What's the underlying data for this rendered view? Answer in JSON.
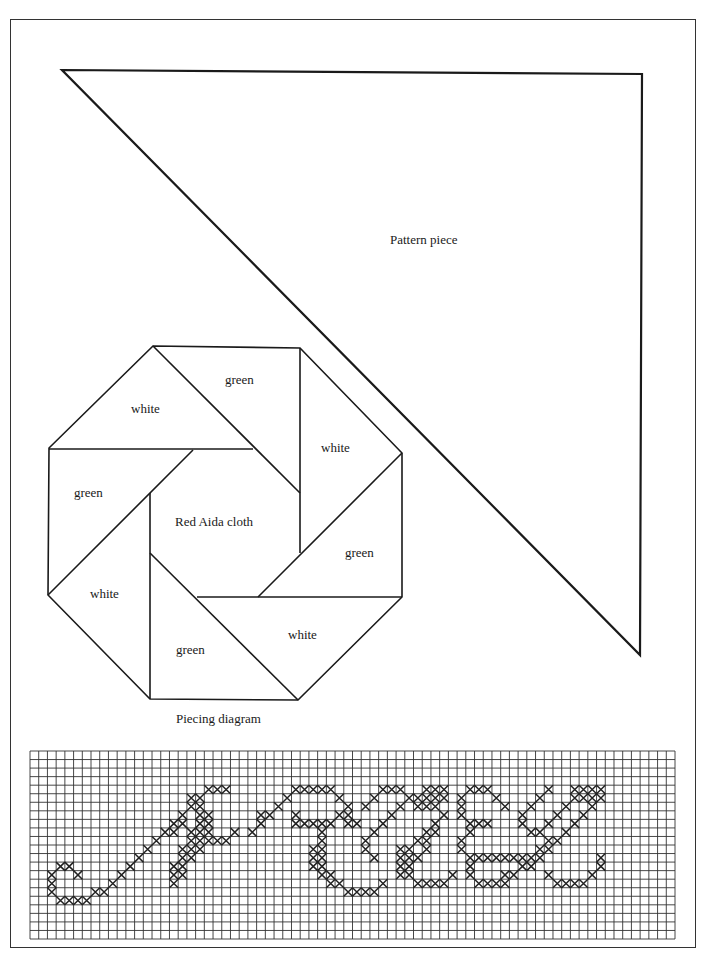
{
  "pattern_piece": {
    "label": "Pattern piece"
  },
  "piecing_diagram": {
    "caption": "Piecing diagram",
    "center_label": "Red Aida cloth",
    "pieces": [
      {
        "label": "white"
      },
      {
        "label": "green"
      },
      {
        "label": "white"
      },
      {
        "label": "green"
      },
      {
        "label": "white"
      },
      {
        "label": "green"
      },
      {
        "label": "white"
      },
      {
        "label": "green"
      }
    ]
  },
  "chart": {
    "columns": 74,
    "rows": 22,
    "stitches": [
      [
        3,
        13
      ],
      [
        4,
        13
      ],
      [
        2,
        14
      ],
      [
        5,
        14
      ],
      [
        2,
        15
      ],
      [
        2,
        16
      ],
      [
        3,
        17
      ],
      [
        4,
        17
      ],
      [
        5,
        17
      ],
      [
        6,
        17
      ],
      [
        7,
        16
      ],
      [
        8,
        16
      ],
      [
        9,
        15
      ],
      [
        10,
        14
      ],
      [
        11,
        13
      ],
      [
        12,
        12
      ],
      [
        13,
        11
      ],
      [
        14,
        10
      ],
      [
        15,
        9
      ],
      [
        16,
        8
      ],
      [
        17,
        7
      ],
      [
        18,
        6
      ],
      [
        19,
        5
      ],
      [
        20,
        4
      ],
      [
        21,
        4
      ],
      [
        22,
        4
      ],
      [
        18,
        5
      ],
      [
        17,
        8
      ],
      [
        16,
        9
      ],
      [
        19,
        6
      ],
      [
        19,
        7
      ],
      [
        20,
        7
      ],
      [
        19,
        8
      ],
      [
        20,
        8
      ],
      [
        18,
        9
      ],
      [
        19,
        9
      ],
      [
        20,
        9
      ],
      [
        18,
        10
      ],
      [
        19,
        10
      ],
      [
        20,
        10
      ],
      [
        21,
        10
      ],
      [
        22,
        10
      ],
      [
        17,
        11
      ],
      [
        18,
        11
      ],
      [
        19,
        11
      ],
      [
        23,
        9
      ],
      [
        17,
        12
      ],
      [
        18,
        12
      ],
      [
        16,
        13
      ],
      [
        17,
        13
      ],
      [
        16,
        14
      ],
      [
        17,
        14
      ],
      [
        16,
        15
      ],
      [
        25,
        9
      ],
      [
        26,
        8
      ],
      [
        27,
        7
      ],
      [
        28,
        6
      ],
      [
        29,
        5
      ],
      [
        30,
        4
      ],
      [
        31,
        4
      ],
      [
        26,
        7
      ],
      [
        30,
        7
      ],
      [
        30,
        8
      ],
      [
        32,
        4
      ],
      [
        33,
        4
      ],
      [
        34,
        4
      ],
      [
        35,
        5
      ],
      [
        36,
        6
      ],
      [
        35,
        7
      ],
      [
        34,
        8
      ],
      [
        33,
        8
      ],
      [
        32,
        8
      ],
      [
        31,
        8
      ],
      [
        36,
        7
      ],
      [
        36,
        8
      ],
      [
        37,
        8
      ],
      [
        33,
        9
      ],
      [
        33,
        10
      ],
      [
        32,
        11
      ],
      [
        33,
        11
      ],
      [
        32,
        12
      ],
      [
        33,
        12
      ],
      [
        32,
        13
      ],
      [
        33,
        13
      ],
      [
        33,
        14
      ],
      [
        34,
        14
      ],
      [
        34,
        15
      ],
      [
        35,
        15
      ],
      [
        36,
        16
      ],
      [
        37,
        16
      ],
      [
        38,
        16
      ],
      [
        39,
        16
      ],
      [
        40,
        15
      ],
      [
        38,
        6
      ],
      [
        39,
        5
      ],
      [
        40,
        4
      ],
      [
        41,
        4
      ],
      [
        42,
        4
      ],
      [
        43,
        5
      ],
      [
        42,
        6
      ],
      [
        41,
        7
      ],
      [
        40,
        8
      ],
      [
        39,
        9
      ],
      [
        38,
        10
      ],
      [
        38,
        11
      ],
      [
        39,
        12
      ],
      [
        44,
        5
      ],
      [
        44,
        6
      ],
      [
        45,
        4
      ],
      [
        46,
        4
      ],
      [
        47,
        4
      ],
      [
        45,
        5
      ],
      [
        46,
        5
      ],
      [
        47,
        5
      ],
      [
        45,
        6
      ],
      [
        46,
        6
      ],
      [
        47,
        7
      ],
      [
        46,
        8
      ],
      [
        46,
        9
      ],
      [
        45,
        9
      ],
      [
        45,
        10
      ],
      [
        44,
        10
      ],
      [
        43,
        11
      ],
      [
        42,
        11
      ],
      [
        42,
        12
      ],
      [
        43,
        12
      ],
      [
        42,
        13
      ],
      [
        43,
        13
      ],
      [
        42,
        14
      ],
      [
        43,
        14
      ],
      [
        44,
        15
      ],
      [
        45,
        15
      ],
      [
        46,
        15
      ],
      [
        47,
        15
      ],
      [
        48,
        14
      ],
      [
        44,
        12
      ],
      [
        45,
        11
      ],
      [
        50,
        4
      ],
      [
        51,
        4
      ],
      [
        52,
        4
      ],
      [
        53,
        5
      ],
      [
        54,
        6
      ],
      [
        52,
        8
      ],
      [
        51,
        8
      ],
      [
        50,
        8
      ],
      [
        49,
        7
      ],
      [
        49,
        6
      ],
      [
        49,
        5
      ],
      [
        50,
        9
      ],
      [
        49,
        10
      ],
      [
        49,
        11
      ],
      [
        50,
        12
      ],
      [
        50,
        13
      ],
      [
        50,
        14
      ],
      [
        51,
        15
      ],
      [
        51,
        12
      ],
      [
        52,
        12
      ],
      [
        53,
        12
      ],
      [
        54,
        12
      ],
      [
        55,
        12
      ],
      [
        56,
        12
      ],
      [
        57,
        13
      ],
      [
        56,
        13
      ],
      [
        55,
        14
      ],
      [
        54,
        14
      ],
      [
        53,
        15
      ],
      [
        54,
        15
      ],
      [
        52,
        15
      ],
      [
        57,
        6
      ],
      [
        58,
        5
      ],
      [
        59,
        4
      ],
      [
        56,
        7
      ],
      [
        56,
        8
      ],
      [
        57,
        9
      ],
      [
        58,
        9
      ],
      [
        59,
        8
      ],
      [
        60,
        7
      ],
      [
        61,
        6
      ],
      [
        62,
        5
      ],
      [
        62,
        4
      ],
      [
        63,
        4
      ],
      [
        64,
        4
      ],
      [
        65,
        4
      ],
      [
        63,
        5
      ],
      [
        64,
        5
      ],
      [
        65,
        5
      ],
      [
        64,
        6
      ],
      [
        63,
        7
      ],
      [
        62,
        8
      ],
      [
        61,
        9
      ],
      [
        60,
        10
      ],
      [
        59,
        10
      ],
      [
        58,
        11
      ],
      [
        59,
        11
      ],
      [
        58,
        12
      ],
      [
        57,
        12
      ],
      [
        59,
        14
      ],
      [
        60,
        15
      ],
      [
        61,
        15
      ],
      [
        62,
        15
      ],
      [
        63,
        15
      ],
      [
        64,
        14
      ],
      [
        65,
        13
      ],
      [
        65,
        12
      ]
    ]
  }
}
